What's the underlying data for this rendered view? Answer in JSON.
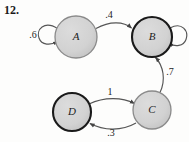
{
  "figure": {
    "problem_number": "12.",
    "type": "markov-chain-state-diagram",
    "background_color": "#fdfdfc",
    "node_fill": "#d4d4d4",
    "node_stroke_light": "#8c8c8c",
    "node_stroke_dark": "#1a1a1a",
    "edge_color": "#555555",
    "text_color": "#1c1c1c"
  },
  "nodes": [
    {
      "id": "A",
      "label": "A",
      "cx": 76,
      "cy": 37,
      "r": 21,
      "border": "light"
    },
    {
      "id": "B",
      "label": "B",
      "cx": 152,
      "cy": 37,
      "r": 20,
      "border": "dark"
    },
    {
      "id": "C",
      "label": "C",
      "cx": 152,
      "cy": 110,
      "r": 19,
      "border": "light"
    },
    {
      "id": "D",
      "label": "D",
      "cx": 72,
      "cy": 112,
      "r": 19,
      "border": "dark"
    }
  ],
  "edges": [
    {
      "from": "A",
      "to": "A",
      "label": ".6",
      "kind": "self-loop-left",
      "label_x": 33,
      "label_y": 36
    },
    {
      "from": "A",
      "to": "B",
      "label": ".4",
      "kind": "curve",
      "label_x": 109,
      "label_y": 16
    },
    {
      "from": "B",
      "to": "B",
      "label": "",
      "kind": "self-loop-right",
      "label_x": 0,
      "label_y": 0
    },
    {
      "from": "C",
      "to": "B",
      "label": ".7",
      "kind": "curve",
      "label_x": 170,
      "label_y": 73
    },
    {
      "from": "D",
      "to": "C",
      "label": "1",
      "kind": "curve-top",
      "label_x": 110,
      "label_y": 93
    },
    {
      "from": "C",
      "to": "D",
      "label": ".3",
      "kind": "curve-bottom",
      "label_x": 111,
      "label_y": 134
    }
  ]
}
